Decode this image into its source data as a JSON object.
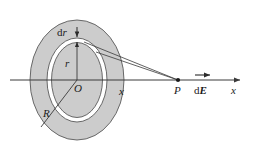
{
  "figure": {
    "labels": {
      "ring_width": "dr",
      "ring_width_d": "d",
      "ring_width_var": "r",
      "ring_radius": "r",
      "center": "O",
      "disc_radius": "R",
      "axis_distance": "x",
      "field_point": "P",
      "field_vector_d": "d",
      "field_vector_E": "E",
      "axis_name": "x"
    },
    "colors": {
      "disc_fill": "#cccccc",
      "disc_stroke": "#555555",
      "ring_fill": "#ffffff",
      "line": "#3a3a3a",
      "text": "#1a1a1a",
      "background": "#ffffff"
    },
    "geometry": {
      "center_x": 77,
      "center_y": 80,
      "disc_rx": 47,
      "disc_ry": 60,
      "ring_outer_rx": 30,
      "ring_outer_ry": 42,
      "ring_inner_rx": 26,
      "ring_inner_ry": 38,
      "axis_start_x": 10,
      "axis_end_x": 243,
      "point_p_x": 178,
      "point_p_y": 80
    },
    "elements": [
      "charged-disc",
      "annular-ring",
      "symmetry-axis",
      "radius-line",
      "ring-radius-arrow",
      "ring-width-arrow",
      "ray-to-point",
      "field-point-dot",
      "field-vector-arrow"
    ]
  }
}
